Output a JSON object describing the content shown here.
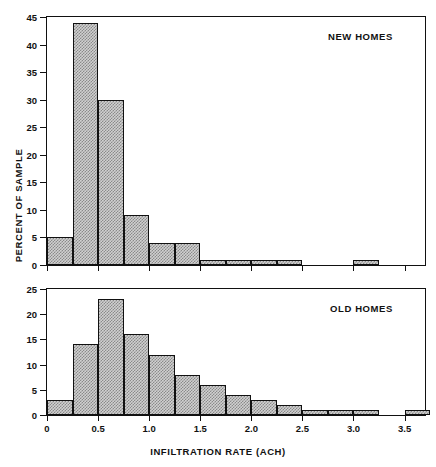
{
  "figure": {
    "xlabel": "INFILTRATION RATE (ACH)",
    "ylabel": "PERCENT OF SAMPLE"
  },
  "chart_data": [
    {
      "type": "bar",
      "title": "NEW HOMES",
      "xlabel": "INFILTRATION RATE (ACH)",
      "ylabel": "PERCENT OF SAMPLE",
      "bin_width": 0.25,
      "xlim": [
        0,
        3.7
      ],
      "ylim": [
        0,
        45
      ],
      "yticks": [
        0,
        5,
        10,
        15,
        20,
        25,
        30,
        35,
        40,
        45
      ],
      "xticks": [
        0,
        0.5,
        1.0,
        1.5,
        2.0,
        2.5,
        3.0,
        3.5
      ],
      "xticklabels": [
        "0",
        "0.5",
        "1.0",
        "1.5",
        "2.0",
        "2.5",
        "3.0",
        "3.5"
      ],
      "grid": false,
      "legend": "none",
      "bins": [
        {
          "x0": 0.0,
          "x1": 0.25,
          "value": 5
        },
        {
          "x0": 0.25,
          "x1": 0.5,
          "value": 44
        },
        {
          "x0": 0.5,
          "x1": 0.75,
          "value": 30
        },
        {
          "x0": 0.75,
          "x1": 1.0,
          "value": 9
        },
        {
          "x0": 1.0,
          "x1": 1.25,
          "value": 4
        },
        {
          "x0": 1.25,
          "x1": 1.5,
          "value": 4
        },
        {
          "x0": 1.5,
          "x1": 1.75,
          "value": 1
        },
        {
          "x0": 1.75,
          "x1": 2.0,
          "value": 1
        },
        {
          "x0": 2.0,
          "x1": 2.25,
          "value": 1
        },
        {
          "x0": 2.25,
          "x1": 2.5,
          "value": 1
        },
        {
          "x0": 2.5,
          "x1": 2.75,
          "value": 0
        },
        {
          "x0": 2.75,
          "x1": 3.0,
          "value": 0
        },
        {
          "x0": 3.0,
          "x1": 3.25,
          "value": 1
        },
        {
          "x0": 3.25,
          "x1": 3.5,
          "value": 0
        },
        {
          "x0": 3.5,
          "x1": 3.75,
          "value": 0
        }
      ]
    },
    {
      "type": "bar",
      "title": "OLD HOMES",
      "xlabel": "INFILTRATION RATE (ACH)",
      "ylabel": "PERCENT OF SAMPLE",
      "bin_width": 0.25,
      "xlim": [
        0,
        3.7
      ],
      "ylim": [
        0,
        25
      ],
      "yticks": [
        0,
        5,
        10,
        15,
        20,
        25
      ],
      "xticks": [
        0,
        0.5,
        1.0,
        1.5,
        2.0,
        2.5,
        3.0,
        3.5
      ],
      "xticklabels": [
        "0",
        "0.5",
        "1.0",
        "1.5",
        "2.0",
        "2.5",
        "3.0",
        "3.5"
      ],
      "grid": false,
      "legend": "none",
      "bins": [
        {
          "x0": 0.0,
          "x1": 0.25,
          "value": 3
        },
        {
          "x0": 0.25,
          "x1": 0.5,
          "value": 14
        },
        {
          "x0": 0.5,
          "x1": 0.75,
          "value": 23
        },
        {
          "x0": 0.75,
          "x1": 1.0,
          "value": 16
        },
        {
          "x0": 1.0,
          "x1": 1.25,
          "value": 12
        },
        {
          "x0": 1.25,
          "x1": 1.5,
          "value": 8
        },
        {
          "x0": 1.5,
          "x1": 1.75,
          "value": 6
        },
        {
          "x0": 1.75,
          "x1": 2.0,
          "value": 4
        },
        {
          "x0": 2.0,
          "x1": 2.25,
          "value": 3
        },
        {
          "x0": 2.25,
          "x1": 2.5,
          "value": 2
        },
        {
          "x0": 2.5,
          "x1": 2.75,
          "value": 1
        },
        {
          "x0": 2.75,
          "x1": 3.0,
          "value": 1
        },
        {
          "x0": 3.0,
          "x1": 3.25,
          "value": 1
        },
        {
          "x0": 3.25,
          "x1": 3.5,
          "value": 0
        },
        {
          "x0": 3.5,
          "x1": 3.75,
          "value": 1
        }
      ]
    }
  ]
}
